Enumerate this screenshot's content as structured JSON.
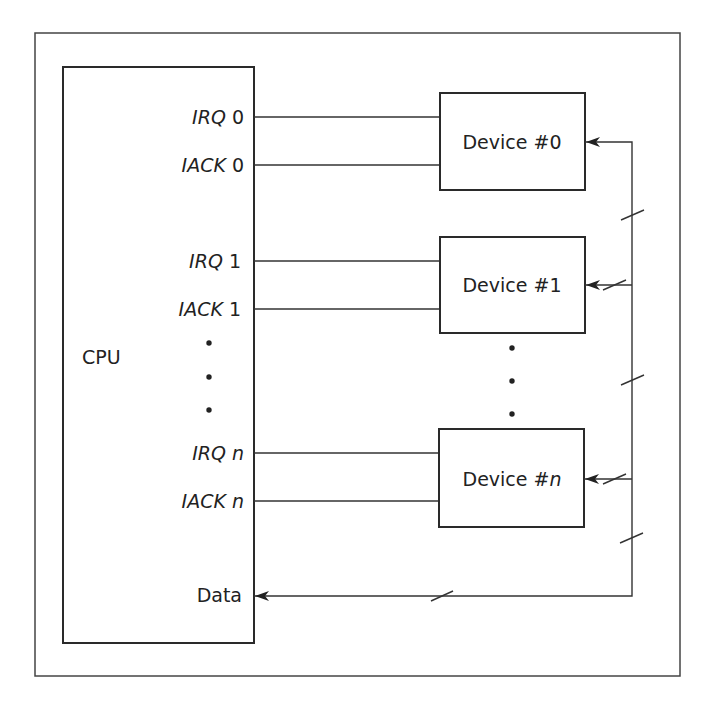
{
  "diagram": {
    "title": "",
    "cpu": {
      "label": "CPU",
      "signals": [
        {
          "name": "IRQ",
          "index": "0"
        },
        {
          "name": "IACK",
          "index": "0"
        },
        {
          "name": "IRQ",
          "index": "1"
        },
        {
          "name": "IACK",
          "index": "1"
        },
        {
          "name": "IRQ",
          "index": "n"
        },
        {
          "name": "IACK",
          "index": "n"
        }
      ],
      "data_label": "Data"
    },
    "devices": [
      {
        "label": "Device #",
        "index": "0"
      },
      {
        "label": "Device #",
        "index": "1"
      },
      {
        "label": "Device #",
        "index": "n"
      }
    ],
    "ellipsis": "•"
  }
}
